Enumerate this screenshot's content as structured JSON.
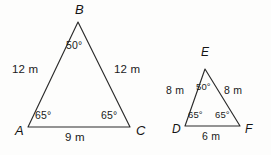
{
  "diagram": {
    "stroke_color": "#2b2b2b",
    "background_color": "#fdfdfc",
    "text_color": "#1a1a1a",
    "figures": [
      {
        "name": "triangle-abc",
        "vertices": [
          {
            "label": "A",
            "x": 28,
            "y": 127
          },
          {
            "label": "B",
            "x": 78,
            "y": 22
          },
          {
            "label": "C",
            "x": 130,
            "y": 127
          }
        ],
        "vertex_labels": {
          "a": "A",
          "b": "B",
          "c": "C"
        },
        "sides": {
          "ab": "12 m",
          "bc": "12 m",
          "ac": "9 m"
        },
        "angles": {
          "a": "65°",
          "b": "50°",
          "c": "65°"
        }
      },
      {
        "name": "triangle-def",
        "vertices": [
          {
            "label": "D",
            "x": 185,
            "y": 126
          },
          {
            "label": "E",
            "x": 205,
            "y": 69
          },
          {
            "label": "F",
            "x": 240,
            "y": 126
          }
        ],
        "vertex_labels": {
          "d": "D",
          "e": "E",
          "f": "F"
        },
        "sides": {
          "de": "8 m",
          "ef": "8 m",
          "df": "6 m"
        },
        "angles": {
          "d": "65°",
          "e": "50°",
          "f": "65°"
        }
      }
    ]
  }
}
